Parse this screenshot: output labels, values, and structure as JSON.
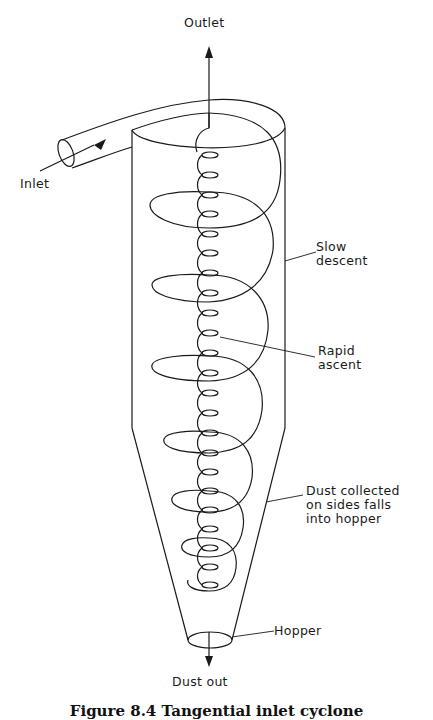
{
  "figure": {
    "caption": "Figure 8.4 Tangential inlet cyclone",
    "labels": {
      "outlet": "Outlet",
      "inlet": "Inlet",
      "slow_descent": "Slow\ndescent",
      "rapid_ascent": "Rapid\nascent",
      "dust_collected": "Dust collected\non sides falls\ninto hopper",
      "hopper": "Hopper",
      "dust_out": "Dust out"
    },
    "colors": {
      "line": "#1a1a1a",
      "background": "#ffffff"
    }
  }
}
